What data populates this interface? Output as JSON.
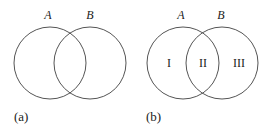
{
  "panels": [
    {
      "id": "a",
      "caption": "(a)",
      "sets": [
        {
          "label": "A",
          "cx": 50,
          "cy": 63,
          "r": 36
        },
        {
          "label": "B",
          "cx": 90,
          "cy": 63,
          "r": 36
        }
      ],
      "regions": []
    },
    {
      "id": "b",
      "caption": "(b)",
      "sets": [
        {
          "label": "A",
          "cx": 183,
          "cy": 63,
          "r": 36
        },
        {
          "label": "B",
          "cx": 222,
          "cy": 63,
          "r": 36
        }
      ],
      "regions": [
        {
          "label": "I"
        },
        {
          "label": "II"
        },
        {
          "label": "III"
        }
      ]
    }
  ],
  "colors": {
    "stroke": "#555555",
    "text": "#222222",
    "background": "#ffffff"
  }
}
